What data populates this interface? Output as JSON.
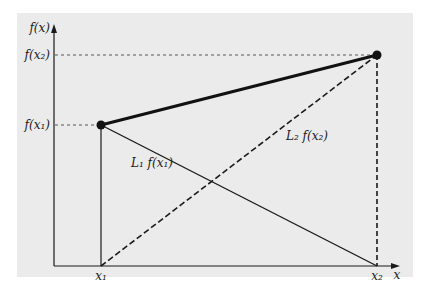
{
  "diagram": {
    "background_color": "#ebebeb",
    "line_color": "#1a1a1a",
    "axes": {
      "y_label": "f(x)",
      "x_label": "x"
    },
    "y_ticks": [
      {
        "id": "f_x2",
        "label": "f(x₂)"
      },
      {
        "id": "f_x1",
        "label": "f(x₁)"
      }
    ],
    "x_ticks": [
      {
        "id": "x1",
        "label": "x₁"
      },
      {
        "id": "x2",
        "label": "x₂"
      }
    ],
    "points": [
      {
        "id": "p1",
        "x_label": "x₁",
        "y_label": "f(x₁)"
      },
      {
        "id": "p2",
        "x_label": "x₂",
        "y_label": "f(x₂)"
      }
    ],
    "annotations": {
      "l1": "L₁ f(x₁)",
      "l2": "L₂ f(x₂)"
    }
  }
}
